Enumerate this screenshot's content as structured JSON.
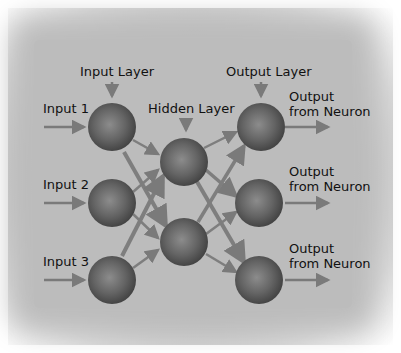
{
  "diagram": {
    "type": "neural-network",
    "colors": {
      "background": "#bcbcbc",
      "neuron": "#5a5a5a",
      "neuron_highlight": "#8a8a8a",
      "arrow": "#808080",
      "text": "#111111"
    },
    "layer_labels": {
      "input": "Input Layer",
      "hidden": "Hidden Layer",
      "output": "Output Layer"
    },
    "inputs": [
      {
        "label": "Input 1"
      },
      {
        "label": "Input 2"
      },
      {
        "label": "Input 3"
      }
    ],
    "outputs": [
      {
        "line1": "Output",
        "line2": "from Neuron"
      },
      {
        "line1": "Output",
        "line2": "from Neuron"
      },
      {
        "line1": "Output",
        "line2": "from Neuron"
      }
    ],
    "layers": {
      "input": 3,
      "hidden": 2,
      "output": 3
    },
    "connections": "fully-connected"
  }
}
